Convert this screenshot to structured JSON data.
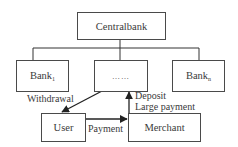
{
  "diagram": {
    "nodes": {
      "central": {
        "label": "Centralbank"
      },
      "bank_first": {
        "label": "Bank",
        "subscript": "1"
      },
      "bank_middle": {
        "label": "……"
      },
      "bank_last": {
        "label": "Bank",
        "subscript": "n"
      },
      "user": {
        "label": "User"
      },
      "merchant": {
        "label": "Merchant"
      }
    },
    "edges": [
      {
        "from": "central",
        "to": "bank_first",
        "label": ""
      },
      {
        "from": "central",
        "to": "bank_middle",
        "label": ""
      },
      {
        "from": "central",
        "to": "bank_last",
        "label": ""
      },
      {
        "from": "bank_middle",
        "to": "user",
        "label": "Withdrawal"
      },
      {
        "from": "merchant",
        "to": "bank_middle",
        "label": "Deposit\nLarge payment"
      },
      {
        "from": "user",
        "to": "merchant",
        "label": "Payment"
      }
    ],
    "edge_labels": {
      "withdrawal": "Withdrawal",
      "deposit": "Deposit",
      "large_payment": "Large payment",
      "payment": "Payment"
    },
    "colors": {
      "line": "#333333",
      "text": "#3a3a3a",
      "box_border": "#4a4a4a"
    }
  }
}
